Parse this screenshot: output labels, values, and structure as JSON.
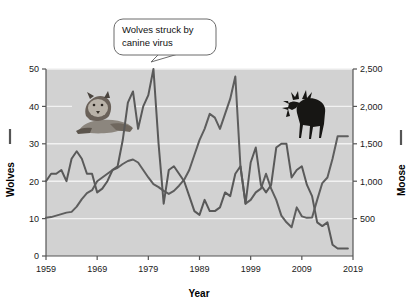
{
  "chart_data": {
    "type": "line",
    "title": "",
    "xlabel": "Year",
    "ylabel_left": "Wolves",
    "ylabel_right": "Moose",
    "xlim": [
      1959,
      2019
    ],
    "xticks": [
      1959,
      1969,
      1979,
      1989,
      1999,
      2009,
      2019
    ],
    "xticklabels": [
      "1959",
      "1969",
      "1979",
      "1989",
      "1999",
      "2009",
      "2019"
    ],
    "ylim_left": [
      0,
      50
    ],
    "yticks_left": [
      0,
      10,
      20,
      30,
      40,
      50
    ],
    "yticklabels_left": [
      "0",
      "10",
      "20",
      "30",
      "40",
      "50"
    ],
    "ylim_right": [
      0,
      2500
    ],
    "yticks_right": [
      0,
      500,
      1000,
      1500,
      2000,
      2500
    ],
    "yticklabels_right": [
      "0",
      "500",
      "1,000",
      "1,500",
      "2,000",
      "2,500"
    ],
    "grid": true,
    "legend_position": "axis-labels",
    "annotations": [
      {
        "name": "canine-virus-callout",
        "text_line1": "Wolves struck by",
        "text_line2": "canine virus",
        "points_to_year": 1980,
        "points_to_value": 50
      }
    ],
    "images": [
      {
        "name": "wolf-photo",
        "label": "wolf"
      },
      {
        "name": "moose-photo",
        "label": "moose"
      }
    ],
    "colors": {
      "plot_background": "#d2d2d2",
      "grid": "#f2f2f2",
      "wolves_line": "#595959",
      "moose_line": "#5e5e5e",
      "axis": "#555555",
      "text": "#111111",
      "page_background": "#ffffff"
    },
    "series": [
      {
        "name": "Wolves",
        "axis": "left",
        "x": [
          1959,
          1960,
          1961,
          1962,
          1963,
          1964,
          1965,
          1966,
          1967,
          1968,
          1969,
          1970,
          1971,
          1972,
          1973,
          1974,
          1975,
          1976,
          1977,
          1978,
          1979,
          1980,
          1981,
          1982,
          1983,
          1984,
          1985,
          1986,
          1987,
          1988,
          1989,
          1990,
          1991,
          1992,
          1993,
          1994,
          1995,
          1996,
          1997,
          1998,
          1999,
          2000,
          2001,
          2002,
          2003,
          2004,
          2005,
          2006,
          2007,
          2008,
          2009,
          2010,
          2011,
          2012,
          2013,
          2014,
          2015,
          2016,
          2017,
          2018
        ],
        "values": [
          20,
          22,
          22,
          23,
          20,
          26,
          28,
          26,
          22,
          22,
          17,
          18,
          20,
          23,
          24,
          31,
          41,
          44,
          34,
          40,
          43,
          50,
          30,
          14,
          23,
          24,
          22,
          20,
          16,
          12,
          11,
          15,
          12,
          12,
          13,
          17,
          16,
          22,
          24,
          14,
          25,
          29,
          19,
          17,
          19,
          29,
          30,
          30,
          21,
          23,
          24,
          19,
          16,
          9,
          8,
          9,
          3,
          2,
          2,
          2
        ]
      },
      {
        "name": "Moose",
        "axis": "right",
        "x": [
          1959,
          1960,
          1961,
          1962,
          1963,
          1964,
          1965,
          1966,
          1967,
          1968,
          1969,
          1970,
          1971,
          1972,
          1973,
          1974,
          1975,
          1976,
          1977,
          1978,
          1979,
          1980,
          1981,
          1982,
          1983,
          1984,
          1985,
          1986,
          1987,
          1988,
          1989,
          1990,
          1991,
          1992,
          1993,
          1994,
          1995,
          1996,
          1997,
          1998,
          1999,
          2000,
          2001,
          2002,
          2003,
          2004,
          2005,
          2006,
          2007,
          2008,
          2009,
          2010,
          2011,
          2012,
          2013,
          2014,
          2015,
          2016,
          2017,
          2018
        ],
        "values": [
          510,
          520,
          540,
          560,
          580,
          590,
          660,
          760,
          840,
          880,
          1000,
          1050,
          1100,
          1150,
          1180,
          1230,
          1270,
          1290,
          1250,
          1150,
          1050,
          960,
          920,
          870,
          830,
          870,
          940,
          1020,
          1150,
          1350,
          1550,
          1700,
          1900,
          1850,
          1700,
          1900,
          2100,
          2400,
          1200,
          700,
          750,
          850,
          900,
          1100,
          900,
          750,
          540,
          450,
          385,
          650,
          530,
          510,
          515,
          750,
          975,
          1050,
          1300,
          1600,
          1600,
          1600
        ]
      }
    ]
  },
  "axis_labels": {
    "wolves": "Wolves",
    "moose": "Moose",
    "year": "Year"
  },
  "callout": {
    "line1": "Wolves struck by",
    "line2": "canine virus"
  }
}
